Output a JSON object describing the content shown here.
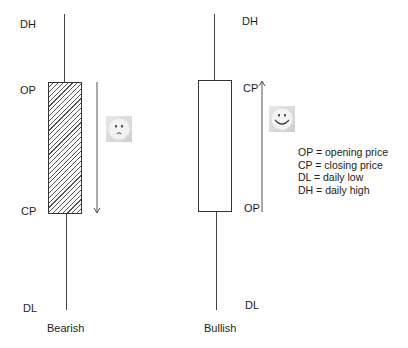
{
  "bearish": {
    "title": "Bearish",
    "labels": {
      "top": "DH",
      "open": "OP",
      "close": "CP",
      "bottom": "DL"
    },
    "arrow_direction": "down",
    "face": "sad-face"
  },
  "bullish": {
    "title": "Bullish",
    "labels": {
      "top": "DH",
      "close": "CP",
      "open": "OP",
      "bottom": "DL"
    },
    "arrow_direction": "up",
    "face": "happy-face"
  },
  "legend": {
    "items": [
      "OP = opening price",
      "CP = closing price",
      "DL = daily low",
      "DH = daily high"
    ]
  }
}
